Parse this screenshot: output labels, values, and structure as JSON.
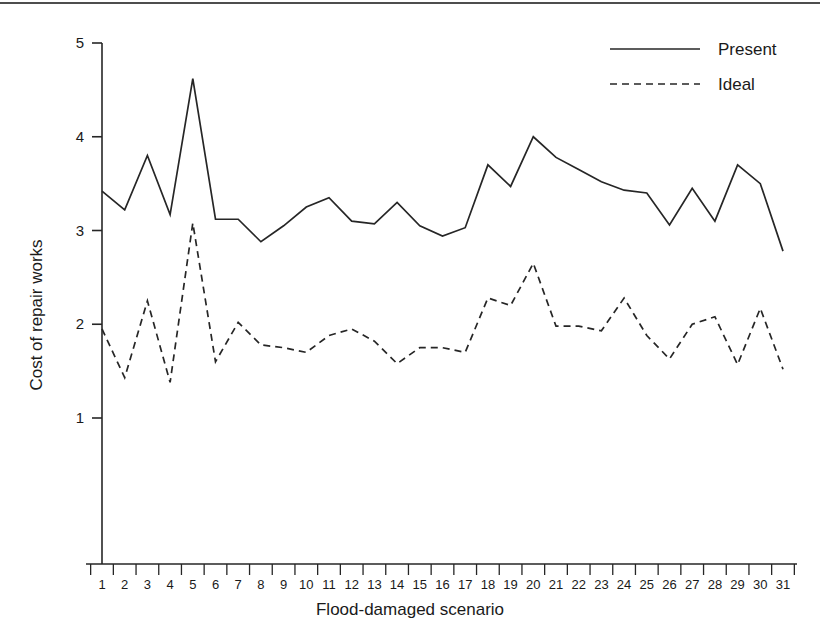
{
  "chart_data": {
    "type": "line",
    "title": "",
    "xlabel": "Flood-damaged scenario",
    "ylabel": "Cost of repair works",
    "categories": [
      "1",
      "2",
      "3",
      "4",
      "5",
      "6",
      "7",
      "8",
      "9",
      "10",
      "11",
      "12",
      "13",
      "14",
      "15",
      "16",
      "17",
      "18",
      "19",
      "20",
      "21",
      "22",
      "23",
      "24",
      "25",
      "26",
      "27",
      "28",
      "29",
      "30",
      "31"
    ],
    "xlim": [
      1,
      31
    ],
    "ylim": [
      0.35,
      5
    ],
    "yticks": [
      "1",
      "2",
      "3",
      "4",
      "5"
    ],
    "ytick_values": [
      1,
      2,
      3,
      4,
      5
    ],
    "grid": false,
    "legend_position": "top-right",
    "series": [
      {
        "name": "Present",
        "style": "solid",
        "color": "#262626",
        "values": [
          3.42,
          3.22,
          3.8,
          3.17,
          4.62,
          3.12,
          3.12,
          2.88,
          3.05,
          3.25,
          3.35,
          3.1,
          3.07,
          3.3,
          3.05,
          2.94,
          3.03,
          3.7,
          3.47,
          4.0,
          3.78,
          3.65,
          3.52,
          3.43,
          3.4,
          3.06,
          3.45,
          3.1,
          3.7,
          3.5,
          2.78
        ]
      },
      {
        "name": "Ideal",
        "style": "dashed",
        "color": "#262626",
        "values": [
          1.95,
          1.43,
          2.25,
          1.38,
          3.08,
          1.6,
          2.02,
          1.78,
          1.75,
          1.7,
          1.88,
          1.95,
          1.82,
          1.58,
          1.75,
          1.75,
          1.7,
          2.28,
          2.2,
          2.65,
          1.98,
          1.98,
          1.93,
          2.28,
          1.88,
          1.63,
          2.0,
          2.08,
          1.57,
          2.17,
          1.52
        ]
      }
    ]
  },
  "legend": {
    "entries": [
      {
        "label": "Present"
      },
      {
        "label": "Ideal"
      }
    ]
  },
  "axes": {
    "y_title": "Cost of repair works",
    "x_title": "Flood-damaged scenario"
  }
}
